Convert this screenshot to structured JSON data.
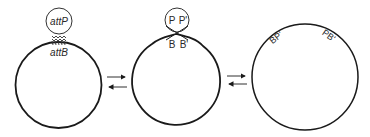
{
  "diagram": {
    "colors": {
      "stroke": "#1a1a1a",
      "text": "#2a2a2a",
      "background": "#ffffff"
    },
    "stage1": {
      "phage_site_label": "attP",
      "bacterial_site_label": "attB"
    },
    "stage2": {
      "phage_labels": {
        "left": "P",
        "right": "P'"
      },
      "bacterial_labels": {
        "left": "B",
        "right": "B'"
      }
    },
    "stage3": {
      "hybrid_site_left": "BP'",
      "hybrid_site_right": "PB'"
    },
    "arrows": [
      {
        "between": "stage1-stage2",
        "type": "reversible-equilibrium"
      },
      {
        "between": "stage2-stage3",
        "type": "reversible-equilibrium"
      }
    ]
  }
}
